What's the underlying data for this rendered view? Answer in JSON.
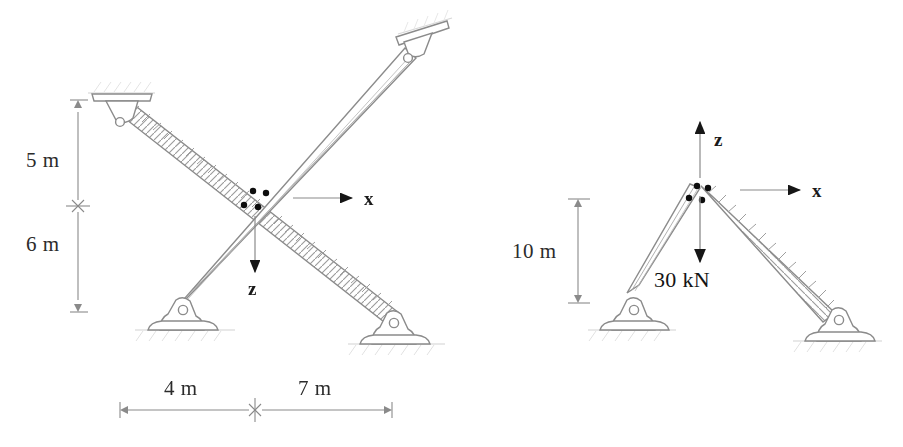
{
  "figure": {
    "style": "hand-drawn pencil line art, scanned",
    "line_color": "#8d8d8d",
    "text_color": "#1e1e1e",
    "bolt_color": "#111111",
    "background": "#ffffff"
  },
  "left_figure": {
    "name": "cross-braced-truss",
    "description": "X-shaped cross brace with two ceiling supports and two ground supports",
    "dimensions": {
      "vertical_top": "5 m",
      "vertical_bottom": "6 m",
      "horizontal_left": "4 m",
      "horizontal_right": "7 m"
    },
    "axes": {
      "x_label": "x",
      "x_direction": "right",
      "z_label": "z",
      "z_direction": "down"
    },
    "joint": {
      "name": "crossing-joint",
      "bolt_count": 4
    },
    "supports": [
      {
        "name": "top-left-ceiling-support",
        "type": "pin"
      },
      {
        "name": "top-right-ceiling-support",
        "type": "pin"
      },
      {
        "name": "bottom-left-ground-support",
        "type": "pin"
      },
      {
        "name": "bottom-right-ground-support",
        "type": "pin"
      }
    ]
  },
  "right_figure": {
    "name": "gable-frame-truss",
    "description": "Two-member A-frame with apex joint loaded vertically",
    "dimensions": {
      "vertical_height": "10 m"
    },
    "axes": {
      "x_label": "x",
      "x_direction": "right",
      "z_label": "z",
      "z_direction": "up"
    },
    "load": {
      "label": "30 kN",
      "magnitude": 30,
      "unit": "kN",
      "direction": "down"
    },
    "joint": {
      "name": "apex-joint",
      "bolt_count": 4
    },
    "supports": [
      {
        "name": "left-ground-support",
        "type": "pin"
      },
      {
        "name": "right-ground-support",
        "type": "pin"
      }
    ]
  }
}
